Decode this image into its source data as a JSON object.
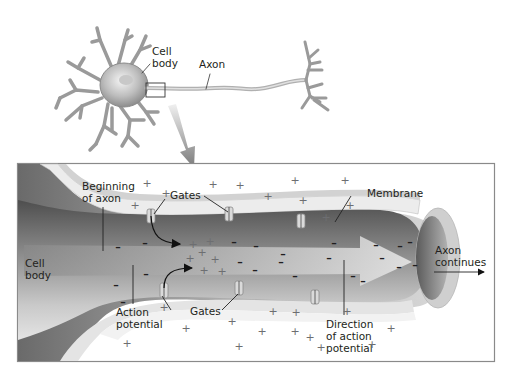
{
  "figure": {
    "colors": {
      "background": "#ffffff",
      "box_border": "#8a8a8a",
      "membrane_light": "#e9e9e9",
      "membrane_dark": "#9b9b9b",
      "axoplasm": "#5e5e5e",
      "label_text": "#231f20",
      "plus_sign": "#6d6e71",
      "minus_sign": "#1f1f1f"
    }
  },
  "neuron": {
    "labels": {
      "cell_body": [
        "Cell",
        "body"
      ],
      "axon": "Axon"
    },
    "zoom_box": "magnified region at beginning of axon",
    "zoom_arrow": "arrow pointing to enlarged view"
  },
  "detail": {
    "labels": {
      "beginning_of_axon": [
        "Beginning",
        "of axon"
      ],
      "gates_top": "Gates",
      "gates_bottom": "Gates",
      "membrane": "Membrane",
      "cell_body": [
        "Cell",
        "body"
      ],
      "axon_continues": [
        "Axon",
        "continues"
      ],
      "action_potential": [
        "Action",
        "potential"
      ],
      "direction": [
        "Direction",
        "of action",
        "potential"
      ]
    },
    "plus_positions": [
      [
        147,
        183
      ],
      [
        166,
        193
      ],
      [
        213,
        184
      ],
      [
        240,
        185
      ],
      [
        295,
        180
      ],
      [
        268,
        196
      ],
      [
        303,
        200
      ],
      [
        345,
        180
      ],
      [
        350,
        205
      ],
      [
        326,
        217
      ],
      [
        135,
        205
      ],
      [
        193,
        244
      ],
      [
        210,
        241
      ],
      [
        202,
        252
      ],
      [
        190,
        258
      ],
      [
        215,
        259
      ],
      [
        204,
        270
      ],
      [
        222,
        271
      ],
      [
        164,
        307
      ],
      [
        186,
        328
      ],
      [
        232,
        321
      ],
      [
        239,
        346
      ],
      [
        273,
        311
      ],
      [
        262,
        331
      ],
      [
        296,
        312
      ],
      [
        295,
        331
      ],
      [
        321,
        347
      ],
      [
        310,
        337
      ],
      [
        372,
        344
      ],
      [
        391,
        328
      ],
      [
        127,
        343
      ],
      [
        347,
        311
      ]
    ],
    "minus_positions": [
      [
        118,
        247
      ],
      [
        145,
        243
      ],
      [
        234,
        242
      ],
      [
        256,
        246
      ],
      [
        283,
        254
      ],
      [
        329,
        258
      ],
      [
        334,
        243
      ],
      [
        376,
        245
      ],
      [
        400,
        246
      ],
      [
        410,
        242
      ],
      [
        415,
        265
      ],
      [
        382,
        258
      ],
      [
        399,
        267
      ],
      [
        363,
        281
      ],
      [
        255,
        270
      ],
      [
        240,
        262
      ],
      [
        295,
        276
      ],
      [
        281,
        262
      ],
      [
        353,
        276
      ],
      [
        116,
        285
      ],
      [
        146,
        274
      ],
      [
        123,
        302
      ]
    ]
  }
}
